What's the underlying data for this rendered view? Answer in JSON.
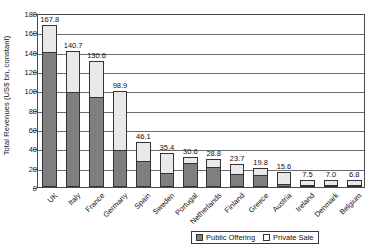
{
  "chart_data": {
    "type": "bar",
    "subtype": "stacked-vertical",
    "title": "",
    "xlabel": "",
    "ylabel": "Total Revenues (US$ bn, constant)",
    "ylim": [
      0,
      180
    ],
    "ytick_step": 20,
    "yticks": [
      0,
      20,
      40,
      60,
      80,
      100,
      120,
      140,
      160,
      180
    ],
    "grid": true,
    "grid_axis": "y",
    "legend_position": "bottom-right",
    "categories": [
      "UK",
      "Italy",
      "France",
      "Germany",
      "Spain",
      "Sweden",
      "Portugal",
      "Netherlands",
      "Finland",
      "Greece",
      "Austria",
      "Ireland",
      "Denmark",
      "Belgium"
    ],
    "series": [
      {
        "name": "Public Offering",
        "color": "#7f7f7f",
        "values": [
          139.8,
          97.9,
          93.6,
          38.2,
          27.0,
          14.6,
          24.4,
          20.6,
          13.2,
          12.1,
          3.4,
          2.2,
          2.1,
          1.4
        ]
      },
      {
        "name": "Private Sale",
        "color": "#e9e9e9",
        "values": [
          28.0,
          42.8,
          37.0,
          60.7,
          19.1,
          20.8,
          6.2,
          8.2,
          10.5,
          7.7,
          12.2,
          5.3,
          4.9,
          5.4
        ]
      }
    ],
    "totals": [
      167.8,
      140.7,
      130.6,
      98.9,
      46.1,
      35.4,
      30.6,
      28.8,
      23.7,
      19.8,
      15.6,
      7.5,
      7.0,
      6.8
    ],
    "data_labels": [
      "167.8",
      "140.7",
      "130.6",
      "98.9",
      "46.1",
      "35.4",
      "30.6",
      "28.8",
      "23.7",
      "19.8",
      "15.6",
      "7.5",
      "7.0",
      "6.8"
    ],
    "ytick_labels": [
      "0",
      "20",
      "40",
      "60",
      "80",
      "100",
      "120",
      "140",
      "160",
      "180"
    ]
  },
  "legend": {
    "items": [
      {
        "label": "Public Offering",
        "key": "public"
      },
      {
        "label": "Private Sale",
        "key": "private"
      }
    ]
  }
}
